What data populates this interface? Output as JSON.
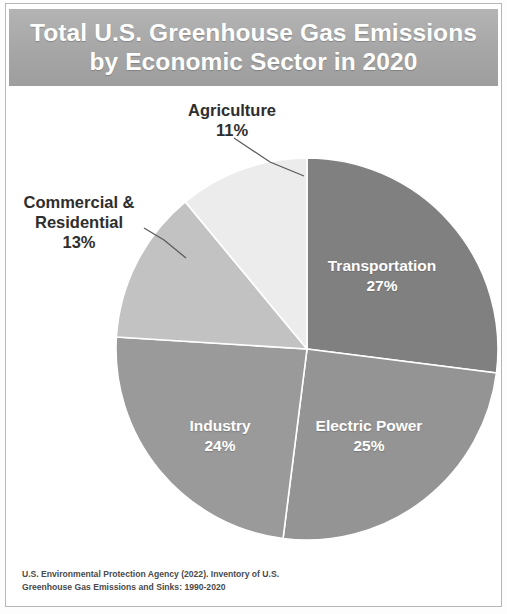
{
  "title": {
    "line1": "Total U.S. Greenhouse Gas Emissions",
    "line2": "by Economic Sector in 2020"
  },
  "labels": {
    "agriculture_name": "Agriculture",
    "agriculture_pct": "11%",
    "commercial_name_line1": "Commercial &",
    "commercial_name_line2": "Residential",
    "commercial_pct": "13%",
    "transportation_name": "Transportation",
    "transportation_pct": "27%",
    "electric_name": "Electric Power",
    "electric_pct": "25%",
    "industry_name": "Industry",
    "industry_pct": "24%"
  },
  "source": {
    "line1": "U.S. Environmental Protection Agency (2022). Inventory of U.S.",
    "line2": "Greenhouse Gas Emissions and Sinks: 1990-2020"
  },
  "colors": {
    "title_bar": "#a6a6a6",
    "transportation": "#808080",
    "electric_power": "#949494",
    "industry": "#9a9a9a",
    "commercial_residential": "#c2c2c2",
    "agriculture": "#ececec",
    "slice_divider": "#ffffff",
    "label_text_dark": "#2e2e2e",
    "label_text_light": "#ffffff"
  },
  "chart_data": {
    "type": "pie",
    "title": "Total U.S. Greenhouse Gas Emissions by Economic Sector in 2020",
    "subtitle": "",
    "xlabel": "",
    "ylabel": "",
    "units": "percent",
    "start_angle_deg": 0,
    "direction": "clockwise",
    "legend": "none",
    "labels_position": "mixed (inside slices for large, callout outside for small)",
    "source": "U.S. Environmental Protection Agency (2022). Inventory of U.S. Greenhouse Gas Emissions and Sinks: 1990-2020",
    "categories": [
      "Transportation",
      "Electric Power",
      "Industry",
      "Commercial & Residential",
      "Agriculture"
    ],
    "values": [
      27,
      25,
      24,
      13,
      11
    ],
    "slices": [
      {
        "name": "Transportation",
        "value": 27,
        "label": "27%",
        "color": "#808080",
        "label_placement": "inside"
      },
      {
        "name": "Electric Power",
        "value": 25,
        "label": "25%",
        "color": "#949494",
        "label_placement": "inside"
      },
      {
        "name": "Industry",
        "value": 24,
        "label": "24%",
        "color": "#9a9a9a",
        "label_placement": "inside"
      },
      {
        "name": "Commercial & Residential",
        "value": 13,
        "label": "13%",
        "color": "#c2c2c2",
        "label_placement": "callout"
      },
      {
        "name": "Agriculture",
        "value": 11,
        "label": "11%",
        "color": "#ececec",
        "label_placement": "callout"
      }
    ]
  }
}
